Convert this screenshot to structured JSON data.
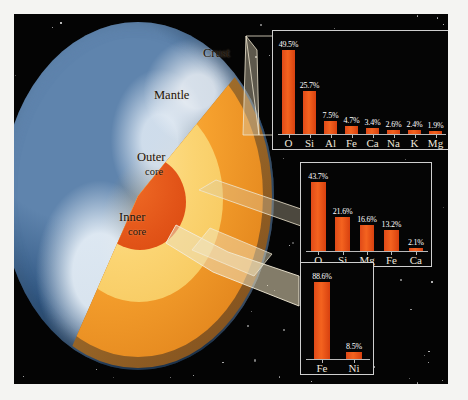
{
  "diagram": {
    "title_visible": false,
    "earth_labels": [
      {
        "name": "crust",
        "text": "Crust"
      },
      {
        "name": "mantle",
        "text": "Mantle"
      },
      {
        "name": "outer-core-line1",
        "text": "Outer"
      },
      {
        "name": "outer-core-line2",
        "text": "core"
      },
      {
        "name": "inner-core-line1",
        "text": "Inner"
      },
      {
        "name": "inner-core-line2",
        "text": "core"
      }
    ],
    "colors": {
      "space": "#040404",
      "crust": "#8d5a22",
      "mantle": "#f6a12e",
      "outer_core": "#fbd472",
      "inner_core": "#e25418",
      "bar": "#e8511a",
      "frame": "#cfcfcf",
      "value_text": "#ffffff",
      "axis_text": "#efe7dc"
    }
  },
  "chart_data": [
    {
      "name": "crust-composition",
      "type": "bar",
      "title": "",
      "xlabel": "",
      "ylabel": "",
      "ylim": [
        0,
        52
      ],
      "grid": false,
      "legend": "none",
      "categories": [
        "O",
        "Si",
        "Al",
        "Fe",
        "Ca",
        "Na",
        "K",
        "Mg"
      ],
      "values": [
        49.5,
        25.7,
        7.5,
        4.7,
        3.4,
        2.6,
        2.4,
        1.9
      ],
      "labels": [
        "49.5%",
        "25.7%",
        "7.5%",
        "4.7%",
        "3.4%",
        "2.6%",
        "2.4%",
        "1.9%"
      ]
    },
    {
      "name": "mantle-composition",
      "type": "bar",
      "title": "",
      "xlabel": "",
      "ylabel": "",
      "ylim": [
        0,
        46
      ],
      "grid": false,
      "legend": "none",
      "categories": [
        "O",
        "Si",
        "Mg",
        "Fe",
        "Ca"
      ],
      "values": [
        43.7,
        21.6,
        16.6,
        13.2,
        2.1
      ],
      "labels": [
        "43.7%",
        "21.6%",
        "16.6%",
        "13.2%",
        "2.1%"
      ]
    },
    {
      "name": "core-composition",
      "type": "bar",
      "title": "",
      "xlabel": "",
      "ylabel": "",
      "ylim": [
        0,
        93
      ],
      "grid": false,
      "legend": "none",
      "categories": [
        "Fe",
        "Ni"
      ],
      "values": [
        88.6,
        8.5
      ],
      "labels": [
        "88.6%",
        "8.5%"
      ]
    }
  ]
}
